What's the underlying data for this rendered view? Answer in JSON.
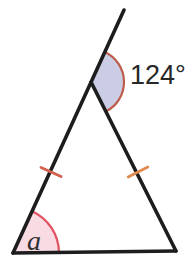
{
  "figure": {
    "width": 189,
    "height": 275,
    "background": "#ffffff",
    "points": {
      "apex": [
        91,
        82
      ],
      "bottom_left": [
        13,
        253
      ],
      "bottom_right": [
        176,
        251
      ],
      "extension_end": [
        124,
        10
      ]
    },
    "edge_style": {
      "stroke": "#1d1d1d",
      "width": 3.6
    },
    "edges": [
      {
        "name": "left-side-extended",
        "from": "extension_end",
        "to": "bottom_left"
      },
      {
        "name": "right-side",
        "from": "apex",
        "to": "bottom_right"
      },
      {
        "name": "base-side",
        "from": "bottom_left",
        "to": "bottom_right"
      }
    ],
    "angle_marks": [
      {
        "name": "exterior-angle",
        "label": "124°",
        "label_pos": [
          130,
          84
        ],
        "vertex": "apex",
        "toward": [
          "extension_end",
          "bottom_right"
        ],
        "radius": 33,
        "fill": "#cbcde5",
        "arc_color": "#bd5c4a",
        "arc_width": 2.2
      },
      {
        "name": "base-angle",
        "label": "a",
        "label_pos": [
          27,
          250
        ],
        "vertex": "bottom_left",
        "toward": [
          "apex",
          "bottom_right"
        ],
        "radius": 46,
        "fill": "#f9dbe4",
        "arc_color": "#e1515f",
        "arc_width": 2.2
      }
    ],
    "tick_marks": [
      {
        "name": "left-tick",
        "center": [
          51,
          172
        ],
        "along": [
          "bottom_left",
          "apex"
        ],
        "half_length": 11,
        "color": "#d3604e",
        "width": 2.8
      },
      {
        "name": "right-tick",
        "center": [
          138,
          172
        ],
        "along": [
          "apex",
          "bottom_right"
        ],
        "half_length": 11,
        "color": "#e08b50",
        "width": 2.8
      }
    ]
  }
}
